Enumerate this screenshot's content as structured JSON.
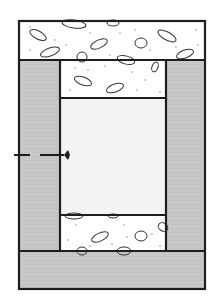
{
  "diagram": {
    "title": "",
    "colors": {
      "outline": "#1e1e1e",
      "gray_fill": "#c4c4c4",
      "light_fill": "#f2f2f2",
      "aggregate_fill": "#ffffff",
      "background": "#ffffff"
    },
    "regions": [
      {
        "name": "top-slab",
        "material": "aggregate-concrete"
      },
      {
        "name": "left-wall",
        "material": "gray-solid"
      },
      {
        "name": "right-wall",
        "material": "gray-solid"
      },
      {
        "name": "upper-inner-fill",
        "material": "aggregate-concrete"
      },
      {
        "name": "center-cavity",
        "material": "light"
      },
      {
        "name": "lower-inner-fill",
        "material": "aggregate-concrete"
      },
      {
        "name": "bottom-slab",
        "material": "gray-solid"
      }
    ],
    "marker": {
      "type": "dashed-line-with-arrowhead",
      "direction": "right"
    }
  }
}
